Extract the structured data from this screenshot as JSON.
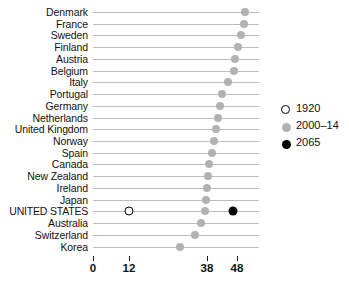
{
  "chart_data": {
    "type": "scatter",
    "title": "",
    "subtitle": "",
    "xlabel": "",
    "ylabel": "",
    "xlim": [
      0,
      55
    ],
    "xticks": [
      0,
      12,
      38,
      48
    ],
    "xtick_labels": [
      "0",
      "12",
      "38",
      "48"
    ],
    "grid": true,
    "legend_position": "right",
    "categories": [
      "Denmark",
      "France",
      "Sweden",
      "Finland",
      "Austria",
      "Belgium",
      "Italy",
      "Portugal",
      "Germany",
      "Netherlands",
      "United Kingdom",
      "Norway",
      "Spain",
      "Canada",
      "New Zealand",
      "Ireland",
      "Japan",
      "UNITED STATES",
      "Australia",
      "Switzerland",
      "Korea"
    ],
    "series": [
      {
        "name": "1920",
        "marker": "open-circle",
        "color": "#ffffff",
        "values": [
          null,
          null,
          null,
          null,
          null,
          null,
          null,
          null,
          null,
          null,
          null,
          null,
          null,
          null,
          null,
          null,
          null,
          12,
          null,
          null,
          null
        ]
      },
      {
        "name": "2000-14",
        "marker": "filled-circle",
        "color": "#b2b2b2",
        "values": [
          50.5,
          50.2,
          49.2,
          48.2,
          47.3,
          47.0,
          45.0,
          43.0,
          42.3,
          41.8,
          41.0,
          40.2,
          39.7,
          38.8,
          38.2,
          38.0,
          37.8,
          37.2,
          36.0,
          34.0,
          29.0
        ]
      },
      {
        "name": "2065",
        "marker": "filled-circle",
        "color": "#000000",
        "values": [
          null,
          null,
          null,
          null,
          null,
          null,
          null,
          null,
          null,
          null,
          null,
          null,
          null,
          null,
          null,
          null,
          null,
          46.5,
          null,
          null,
          null
        ]
      }
    ]
  },
  "legend": {
    "items": [
      {
        "label": "1920",
        "marker": "open-circle"
      },
      {
        "label": "2000–14",
        "marker": "gray-circle"
      },
      {
        "label": "2065",
        "marker": "black-circle"
      }
    ]
  }
}
